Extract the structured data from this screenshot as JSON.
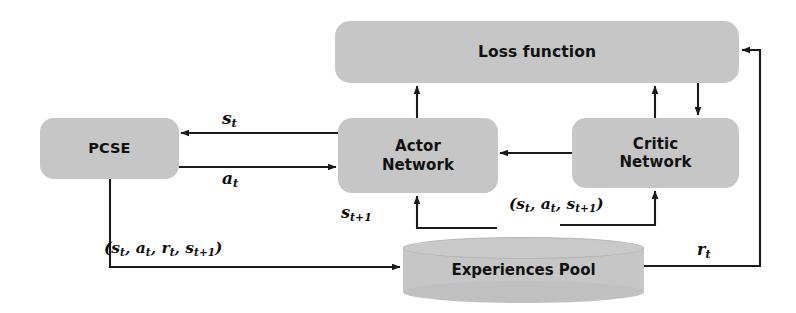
{
  "diagram": {
    "canvas": {
      "width": 796,
      "height": 313,
      "background": "#ffffff"
    },
    "palette": {
      "node_fill": "#c6c6c6",
      "node_text": "#111111",
      "edge_stroke": "#1a1a1a",
      "label_text": "#0d0d0d"
    },
    "nodes": [
      {
        "id": "loss",
        "label": "Loss function",
        "shape": "rounded-rect"
      },
      {
        "id": "actor",
        "label": "Actor\nNetwork",
        "shape": "rounded-rect"
      },
      {
        "id": "critic",
        "label": "Critic\nNetwork",
        "shape": "rounded-rect"
      },
      {
        "id": "pcse",
        "label": "PCSE",
        "shape": "rounded-rect"
      },
      {
        "id": "pool",
        "label": "Experiences Pool",
        "shape": "cylinder"
      }
    ],
    "edge_labels": {
      "state": {
        "base": "s",
        "sub": "t"
      },
      "action": {
        "base": "a",
        "sub": "t"
      },
      "next_state": {
        "base": "s",
        "sub": "t+1"
      },
      "reward": {
        "base": "r",
        "sub": "t"
      },
      "critic_tuple": {
        "open": "(",
        "s": "s",
        "s_sub": "t",
        "comma1": ", ",
        "a": "a",
        "a_sub": "t",
        "comma2": ", ",
        "s2": "s",
        "s2_sub": "t+1",
        "close": ")"
      },
      "transition_tuple": {
        "open": "(",
        "s": "s",
        "s_sub": "t",
        "comma1": ", ",
        "a": "a",
        "a_sub": "t",
        "comma2": ", ",
        "r": "r",
        "r_sub": "t",
        "comma3": ", ",
        "s2": "s",
        "s2_sub": "t+1",
        "close": ")"
      }
    },
    "edges": [
      {
        "id": "actor-to-pcse",
        "from": "actor",
        "to": "pcse",
        "label": "s_t"
      },
      {
        "id": "pcse-to-actor",
        "from": "pcse",
        "to": "actor",
        "label": "a_t"
      },
      {
        "id": "critic-to-actor",
        "from": "critic",
        "to": "actor",
        "label": ""
      },
      {
        "id": "actor-to-loss",
        "from": "actor",
        "to": "loss",
        "label": ""
      },
      {
        "id": "critic-to-loss",
        "from": "critic",
        "to": "loss",
        "label": ""
      },
      {
        "id": "loss-to-critic",
        "from": "loss",
        "to": "critic",
        "label": ""
      },
      {
        "id": "pool-to-actor",
        "from": "pool",
        "to": "actor",
        "label": "s_t+1"
      },
      {
        "id": "pool-to-critic",
        "from": "pool",
        "to": "critic",
        "label": "(s_t, a_t, s_t+1)"
      },
      {
        "id": "pcse-to-pool",
        "from": "pcse",
        "to": "pool",
        "label": "(s_t, a_t, r_t, s_t+1)"
      },
      {
        "id": "pool-to-loss",
        "from": "pool",
        "to": "loss",
        "label": "r_t"
      }
    ]
  }
}
